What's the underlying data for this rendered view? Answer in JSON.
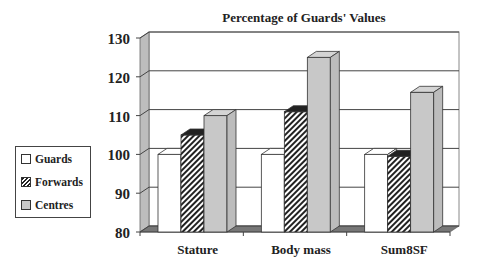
{
  "chart_data": {
    "type": "bar",
    "title": "Percentage of Guards' Values",
    "xlabel": "",
    "ylabel": "",
    "ylim": [
      80,
      130
    ],
    "yticks": [
      80,
      90,
      100,
      110,
      120,
      130
    ],
    "grid": true,
    "legend_position": "left",
    "categories": [
      "Stature",
      "Body mass",
      "Sum8SF"
    ],
    "series": [
      {
        "name": "Guards",
        "values": [
          100,
          100,
          100
        ],
        "fill": "#ffffff"
      },
      {
        "name": "Forwards",
        "values": [
          105,
          111,
          99.5
        ],
        "fill": "hatched"
      },
      {
        "name": "Centres",
        "values": [
          110,
          125,
          116
        ],
        "fill": "#c8c8c8"
      }
    ]
  },
  "legend": {
    "items": [
      {
        "label": "Guards"
      },
      {
        "label": "Forwards"
      },
      {
        "label": "Centres"
      }
    ]
  },
  "axis": {
    "ytick_labels": [
      "130",
      "120",
      "110",
      "100",
      "90",
      "80"
    ],
    "xtick_labels": [
      "Stature",
      "Body mass",
      "Sum8SF"
    ]
  }
}
